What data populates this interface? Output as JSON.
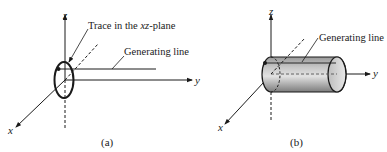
{
  "panel_a": {
    "axis_z": "z",
    "axis_y": "y",
    "axis_x": "x",
    "trace_label_prefix": "Trace in the ",
    "trace_label_plane": "xz",
    "trace_label_suffix": "-plane",
    "generating_line_label": "Generating line",
    "caption": "(a)"
  },
  "panel_b": {
    "axis_z": "z",
    "axis_y": "y",
    "axis_x": "x",
    "generating_line_label": "Generating line",
    "caption": "(b)"
  },
  "colors": {
    "ink": "#1a1a1a",
    "cylinder_light": "#d9d9d9",
    "cylinder_dark": "#8a8a8a"
  }
}
